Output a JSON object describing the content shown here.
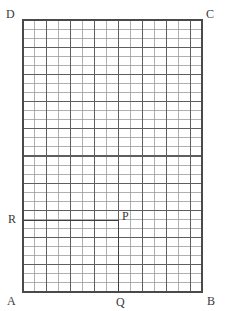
{
  "figure": {
    "background_color": "#ffffff",
    "labels": {
      "A": "A",
      "B": "B",
      "C": "C",
      "D": "D",
      "P": "P",
      "Q": "Q",
      "R": "R"
    },
    "colors": {
      "outline": "#4a4a4a",
      "minor_grid": "#8e8e8e",
      "major_grid": "#5e5e5e",
      "emphasis_line": "#3f3f3f",
      "label_text": "#3a3a3a"
    }
  },
  "chart_data": {
    "type": "scatter",
    "xlabel": "",
    "ylabel": "",
    "grid": true,
    "legend_position": "none",
    "xlim": [
      0,
      15
    ],
    "ylim": [
      0,
      30
    ],
    "rectangle": {
      "name": "ABCD",
      "corners": [
        {
          "label": "A",
          "x": 0,
          "y": 0
        },
        {
          "label": "B",
          "x": 15,
          "y": 0
        },
        {
          "label": "C",
          "x": 15,
          "y": 30
        },
        {
          "label": "D",
          "x": 0,
          "y": 30
        }
      ],
      "width_cells": 15,
      "height_cells": 30
    },
    "points": [
      {
        "label": "P",
        "x": 8,
        "y": 8
      },
      {
        "label": "Q",
        "x": 8,
        "y": 0
      },
      {
        "label": "R",
        "x": 0,
        "y": 8
      }
    ],
    "emphasis_segments": [
      {
        "name": "QP",
        "from": "Q",
        "to": "P",
        "orientation": "vertical"
      },
      {
        "name": "RP",
        "from": "R",
        "to": "P",
        "orientation": "horizontal"
      }
    ],
    "grid_spec": {
      "minor_columns": 15,
      "minor_rows": 30,
      "major_column_every": 2,
      "major_row_every": 3
    }
  },
  "geometry_px": {
    "left": 23,
    "top": 20,
    "right": 202,
    "bottom": 292,
    "cell_width": 11.933,
    "cell_height": 9.067,
    "p_x": 118.5,
    "p_y": 220.5
  }
}
